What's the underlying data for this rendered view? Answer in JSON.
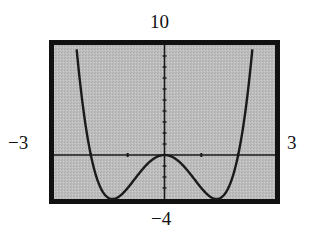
{
  "chart_data": {
    "type": "line",
    "title": "",
    "xlabel": "",
    "ylabel": "",
    "xlim": [
      -3,
      3
    ],
    "ylim": [
      -4,
      10
    ],
    "grid": false,
    "function": "y = x^4 - 4x^2",
    "window_labels": {
      "xmin": "−3",
      "xmax": "3",
      "ymin": "−4",
      "ymax": "10"
    },
    "x_ticks": [
      -2,
      -1,
      1,
      2
    ],
    "y_ticks": [
      -3,
      -2,
      -1,
      1,
      2,
      3,
      4,
      5,
      6,
      7,
      8,
      9
    ],
    "key_points": [
      {
        "label": "local max",
        "x": 0,
        "y": 0
      },
      {
        "label": "min",
        "x": -1.41,
        "y": -4
      },
      {
        "label": "min",
        "x": 1.41,
        "y": -4
      },
      {
        "label": "zero",
        "x": -2,
        "y": 0
      },
      {
        "label": "zero",
        "x": 2,
        "y": 0
      }
    ],
    "colors": {
      "screen": "#b8b8b8",
      "frame": "#111111",
      "curve": "#1a1a1a",
      "axes": "#1a1a1a"
    }
  }
}
